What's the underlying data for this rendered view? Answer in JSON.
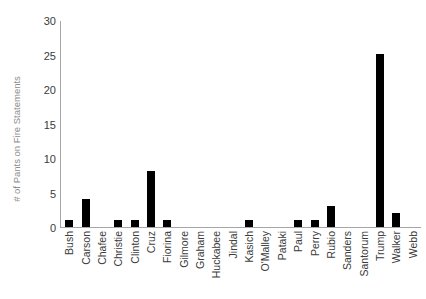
{
  "chart_data": {
    "type": "bar",
    "title": "",
    "subtitle": "",
    "xlabel": "",
    "ylabel": "# of Pants on Fire Statements",
    "ylim": [
      0,
      30
    ],
    "yticks": [
      0,
      5,
      10,
      15,
      20,
      25,
      30
    ],
    "grid": false,
    "legend": false,
    "bar_color": "#000000",
    "axis_color": "#a6a6a6",
    "label_color": "#3b3b3b",
    "ylabel_color": "#8c8c8c",
    "background": "#ffffff",
    "categories": [
      "Bush",
      "Carson",
      "Chafee",
      "Christie",
      "Clinton",
      "Cruz",
      "Fiorina",
      "Gilmore",
      "Graham",
      "Huckabee",
      "Jindal",
      "Kasich",
      "O'Malley",
      "Pataki",
      "Paul",
      "Perry",
      "Rubio",
      "Sanders",
      "Santorum",
      "Trump",
      "Walker",
      "Webb"
    ],
    "values": [
      1,
      4,
      0,
      1,
      1,
      8,
      1,
      0,
      0,
      0,
      0,
      1,
      0,
      0,
      1,
      1,
      3,
      0,
      0,
      25,
      2,
      0
    ]
  }
}
